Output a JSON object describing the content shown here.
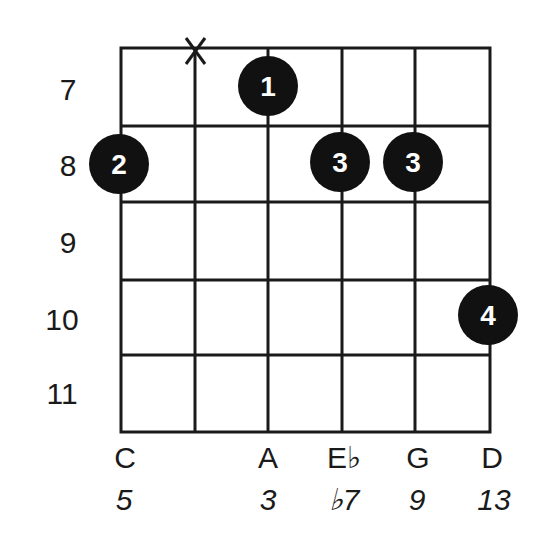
{
  "diagram": {
    "type": "guitar-chord-diagram",
    "frets": [
      "7",
      "8",
      "9",
      "10",
      "11"
    ],
    "strings": 6,
    "muted_strings": [
      2
    ],
    "fingerings": [
      {
        "string": 1,
        "fret": "8",
        "finger": "2"
      },
      {
        "string": 3,
        "fret": "7",
        "finger": "1"
      },
      {
        "string": 4,
        "fret": "8",
        "finger": "3"
      },
      {
        "string": 5,
        "fret": "8",
        "finger": "3"
      },
      {
        "string": 6,
        "fret": "10",
        "finger": "4"
      }
    ],
    "muted_symbol": "X",
    "notes": [
      "C",
      "",
      "A",
      "E♭",
      "G",
      "D"
    ],
    "intervals": [
      "5",
      "",
      "3",
      "♭7",
      "9",
      "13"
    ],
    "colors": {
      "grid": "#1a1a1a",
      "dot": "#111111",
      "dot_text": "#ffffff"
    }
  }
}
